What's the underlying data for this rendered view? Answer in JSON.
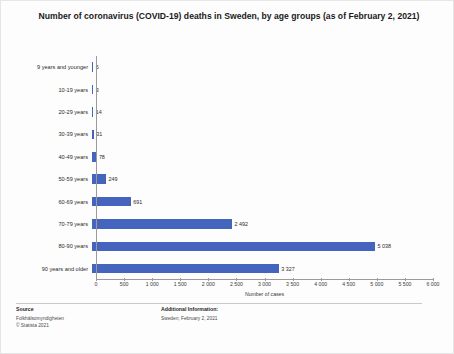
{
  "title": "Number of coronavirus (COVID-19) deaths in Sweden, by age groups (as of February 2, 2021)",
  "chart_data": {
    "type": "bar",
    "orientation": "horizontal",
    "title": "Number of coronavirus (COVID-19) deaths in Sweden, by age groups (as of February 2, 2021)",
    "categories": [
      "9 years and younger",
      "10-19 years",
      "20-29 years",
      "30-39 years",
      "40-49 years",
      "50-59 years",
      "60-69 years",
      "70-79 years",
      "80-90 years",
      "90 years and older"
    ],
    "values": [
      6,
      3,
      14,
      31,
      78,
      249,
      691,
      2492,
      5038,
      3327
    ],
    "value_labels": [
      "6",
      "3",
      "14",
      "31",
      "78",
      "249",
      "691",
      "2 492",
      "5 038",
      "3 327"
    ],
    "xlabel": "Number of cases",
    "ylabel": "",
    "xlim": [
      0,
      6000
    ],
    "xticks": [
      0,
      500,
      1000,
      1500,
      2000,
      2500,
      3000,
      3500,
      4000,
      4500,
      5000,
      5500,
      6000
    ],
    "xtick_labels": [
      "0",
      "500",
      "1 000",
      "1 500",
      "2 000",
      "2 500",
      "3 000",
      "3 500",
      "4 000",
      "4 500",
      "5 000",
      "5 500",
      "6 000"
    ],
    "grid": false,
    "legend": null,
    "bar_color": "#4464bd"
  },
  "footer": {
    "source_heading": "Source",
    "source_lines": [
      "Folkhälsomyndigheten",
      "© Statista 2021"
    ],
    "additional_heading": "Additional Information:",
    "additional_lines": [
      "Sweden; February 2, 2021"
    ]
  }
}
